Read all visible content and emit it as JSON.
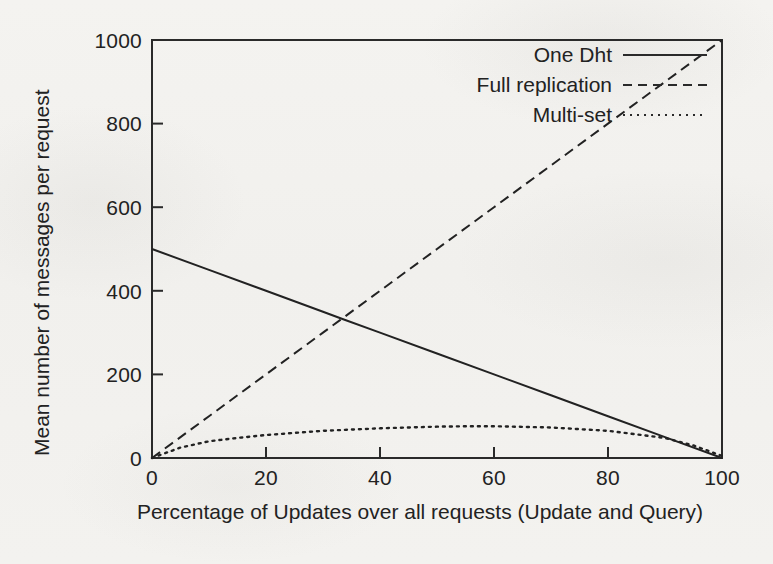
{
  "figure": {
    "background_color": "#f2f1ee",
    "ink_color": "#222222"
  },
  "chart_data": {
    "type": "line",
    "title": "",
    "xlabel": "Percentage of Updates over all requests (Update and Query)",
    "ylabel": "Mean number of messages per request",
    "xlim": [
      0,
      100
    ],
    "ylim": [
      0,
      1000
    ],
    "xticks": [
      "0",
      "20",
      "40",
      "60",
      "80",
      "100"
    ],
    "yticks": [
      "0",
      "200",
      "400",
      "600",
      "800",
      "1000"
    ],
    "grid": false,
    "legend_position": "top-right-inside",
    "series": [
      {
        "name": "One Dht",
        "style": "solid",
        "x": [
          0,
          10,
          20,
          30,
          33.3,
          40,
          50,
          60,
          70,
          80,
          90,
          100
        ],
        "values": [
          500,
          450,
          400,
          350,
          333,
          300,
          250,
          200,
          150,
          100,
          50,
          0
        ]
      },
      {
        "name": "Full replication",
        "style": "dashed",
        "x": [
          0,
          10,
          20,
          30,
          33.3,
          40,
          50,
          60,
          70,
          80,
          90,
          100
        ],
        "values": [
          0,
          100,
          200,
          300,
          333,
          400,
          500,
          600,
          700,
          800,
          900,
          1000
        ]
      },
      {
        "name": "Multi-set",
        "style": "dotted",
        "x": [
          0,
          5,
          10,
          15,
          20,
          30,
          40,
          50,
          55,
          60,
          70,
          80,
          90,
          95,
          100
        ],
        "values": [
          0,
          25,
          40,
          48,
          55,
          65,
          71,
          75,
          76,
          76,
          73,
          65,
          48,
          30,
          5
        ]
      }
    ]
  },
  "axes": {
    "x_tick_labels": [
      "0",
      "20",
      "40",
      "60",
      "80",
      "100"
    ],
    "y_tick_labels": [
      "0",
      "200",
      "400",
      "600",
      "800",
      "1000"
    ],
    "x_title": "Percentage of Updates over all requests (Update and Query)",
    "y_title": "Mean number of messages per request"
  },
  "legend": {
    "entries": [
      {
        "label": "One Dht",
        "style": "solid"
      },
      {
        "label": "Full replication",
        "style": "dashed"
      },
      {
        "label": "Multi-set",
        "style": "dotted"
      }
    ]
  }
}
